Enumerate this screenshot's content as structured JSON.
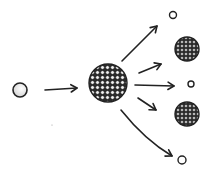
{
  "diagram": {
    "type": "process",
    "style": "hand-drawn sketch",
    "description_label": "Neutron strikes a large nucleus which splits into two fragment nuclei and releases three neutrons",
    "colors": {
      "ink": "#222222",
      "background": "#ffffff",
      "particle_fill": "#e8e8e8",
      "nucleus_fill": "#333333"
    },
    "nodes": [
      {
        "id": "incoming-neutron",
        "kind": "neutron",
        "cx": 20,
        "cy": 90,
        "r": 7
      },
      {
        "id": "target-nucleus",
        "kind": "nucleus",
        "cx": 108,
        "cy": 83,
        "r": 19
      },
      {
        "id": "neutron-top",
        "kind": "neutron",
        "cx": 173,
        "cy": 15,
        "r": 3.5
      },
      {
        "id": "fragment-upper",
        "kind": "nucleus",
        "cx": 187,
        "cy": 49,
        "r": 12
      },
      {
        "id": "neutron-middle",
        "kind": "neutron",
        "cx": 191,
        "cy": 84,
        "r": 3
      },
      {
        "id": "fragment-lower",
        "kind": "nucleus",
        "cx": 187,
        "cy": 114,
        "r": 12
      },
      {
        "id": "neutron-bottom",
        "kind": "neutron",
        "cx": 182,
        "cy": 160,
        "r": 4
      }
    ],
    "edges": [
      {
        "from": "incoming-neutron",
        "to": "target-nucleus",
        "path": "M45 90 L77 88"
      },
      {
        "from": "target-nucleus",
        "to": "neutron-top",
        "path": "M122 61 L157 26"
      },
      {
        "from": "target-nucleus",
        "to": "fragment-upper",
        "path": "M139 73 L161 64"
      },
      {
        "from": "target-nucleus",
        "to": "neutron-middle",
        "path": "M135 85 L174 86"
      },
      {
        "from": "target-nucleus",
        "to": "fragment-lower",
        "path": "M138 98 Q147 104 156 110"
      },
      {
        "from": "target-nucleus",
        "to": "neutron-bottom",
        "path": "M121 110 Q145 140 172 156"
      }
    ]
  }
}
